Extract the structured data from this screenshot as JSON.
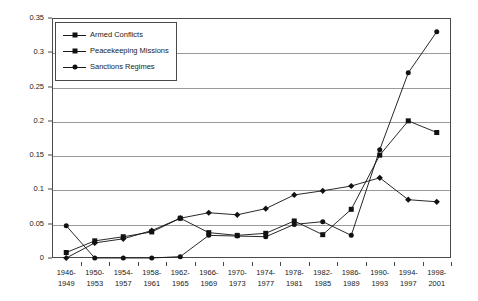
{
  "chart_data": {
    "type": "line",
    "title": "",
    "subtitle": "",
    "xlabel": "",
    "ylabel": "",
    "ylim": [
      0,
      0.35
    ],
    "ytick_step": 0.05,
    "yticks": [
      "0",
      "0.05",
      "0.1",
      "0.15",
      "0.2",
      "0.25",
      "0.3",
      "0.35"
    ],
    "ytick_values": [
      0,
      0.05,
      0.1,
      0.15,
      0.2,
      0.25,
      0.3,
      0.35
    ],
    "grid": "horizontal",
    "legend_position": "top-left-inside",
    "categories": [
      "1946-\n1949",
      "1950-\n1953",
      "1954-\n1957",
      "1958-\n1961",
      "1962-\n1965",
      "1966-\n1969",
      "1970-\n1973",
      "1974-\n1977",
      "1978-\n1981",
      "1982-\n1985",
      "1986-\n1989",
      "1990-\n1993",
      "1994-\n1997",
      "1998-\n2001"
    ],
    "categories_lines": [
      [
        "1946-",
        "1949"
      ],
      [
        "1950-",
        "1953"
      ],
      [
        "1954-",
        "1957"
      ],
      [
        "1958-",
        "1961"
      ],
      [
        "1962-",
        "1965"
      ],
      [
        "1966-",
        "1969"
      ],
      [
        "1970-",
        "1973"
      ],
      [
        "1974-",
        "1977"
      ],
      [
        "1978-",
        "1981"
      ],
      [
        "1982-",
        "1985"
      ],
      [
        "1986-",
        "1989"
      ],
      [
        "1990-",
        "1993"
      ],
      [
        "1994-",
        "1997"
      ],
      [
        "1998-",
        "2001"
      ]
    ],
    "series": [
      {
        "name": "Armed Conflicts",
        "marker": "diamond",
        "color": "#111111",
        "values": [
          0.0,
          0.022,
          0.028,
          0.04,
          0.058,
          0.066,
          0.063,
          0.072,
          0.092,
          0.098,
          0.105,
          0.117,
          0.085,
          0.082
        ]
      },
      {
        "name": "Peacekeeping Missions",
        "marker": "square",
        "color": "#111111",
        "values": [
          0.008,
          0.025,
          0.031,
          0.038,
          0.058,
          0.037,
          0.033,
          0.036,
          0.054,
          0.034,
          0.071,
          0.15,
          0.2,
          0.183
        ]
      },
      {
        "name": "Sanctions Regimes",
        "marker": "circle",
        "color": "#111111",
        "values": [
          0.047,
          0.0,
          0.0,
          0.0,
          0.002,
          0.033,
          0.032,
          0.031,
          0.049,
          0.053,
          0.033,
          0.158,
          0.27,
          0.33
        ]
      }
    ]
  },
  "legend": {
    "items": [
      {
        "label": "Armed Conflicts"
      },
      {
        "label": "Peacekeeping Missions"
      },
      {
        "label": "Sanctions Regimes"
      }
    ]
  }
}
